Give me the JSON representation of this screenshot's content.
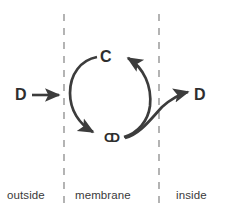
{
  "figure": {
    "stroke_color": "#3c3c3c",
    "dash_color": "#8c8c8c",
    "text_color": "#2e2e2e",
    "label_color": "#3a3a3a",
    "background": "#ffffff"
  },
  "zones": {
    "outside_label": "outside",
    "membrane_label": "membrane",
    "inside_label": "inside"
  },
  "species": {
    "d_outside": "D",
    "d_inside": "D",
    "carrier_top": "C",
    "complex_bottom_c": "C",
    "complex_bottom_d": "D"
  },
  "boundaries": [
    {
      "name": "outer-membrane-boundary",
      "x": 64
    },
    {
      "name": "inner-membrane-boundary",
      "x": 159
    }
  ],
  "arrows": [
    {
      "name": "d-entry-arrow",
      "from": "D (outside)",
      "to": "membrane",
      "style": "straight"
    },
    {
      "name": "binding-arc-arrow",
      "from": "C",
      "to": "CD",
      "style": "arc-left-clockwise"
    },
    {
      "name": "recycle-arc-arrow",
      "from": "CD",
      "to": "C",
      "style": "arc-right-clockwise"
    },
    {
      "name": "d-release-arrow",
      "from": "CD",
      "to": "D (inside)",
      "style": "curved"
    }
  ]
}
